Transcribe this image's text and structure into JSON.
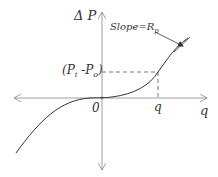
{
  "diagram": {
    "y_axis_label": "Δ P",
    "x_axis_label": "q",
    "origin_label": "0",
    "x_marker_label": "q",
    "y_marker_label": "(P",
    "y_marker_sub1": "i",
    "y_marker_mid": " -P",
    "y_marker_sub2": "o",
    "y_marker_close": ")",
    "slope_label": "Slope=R",
    "slope_sub": "p",
    "colors": {
      "curve": "#333333",
      "axes": "#888888",
      "dashed": "#555555"
    }
  }
}
